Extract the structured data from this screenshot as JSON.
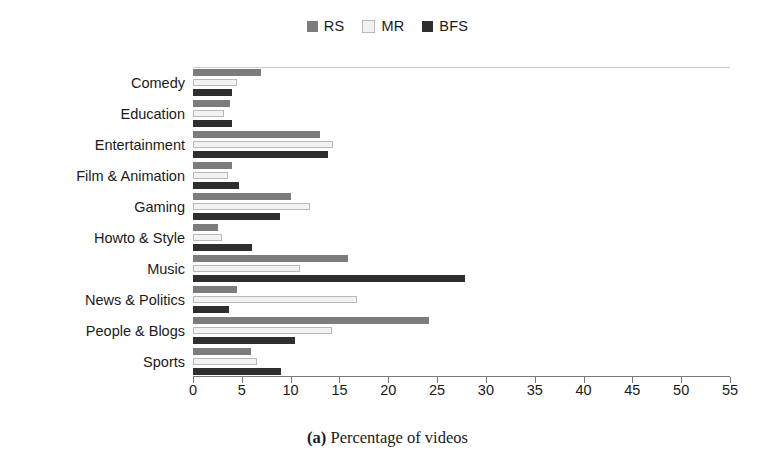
{
  "caption": {
    "label": "(a)",
    "text": " Percentage of videos"
  },
  "legend": {
    "position": "top-center",
    "entries": [
      {
        "name": "RS",
        "color": "#7c7c7c"
      },
      {
        "name": "MR",
        "color": "#f2f2f2"
      },
      {
        "name": "BFS",
        "color": "#2e2e2e"
      }
    ]
  },
  "chart_data": {
    "type": "bar",
    "orientation": "horizontal",
    "title": "",
    "xlabel": "",
    "ylabel": "",
    "xlim": [
      0,
      55
    ],
    "xticks": [
      0,
      5,
      10,
      15,
      20,
      25,
      30,
      35,
      40,
      45,
      50,
      55
    ],
    "grid": false,
    "legend_position": "top-center",
    "categories": [
      "Comedy",
      "Education",
      "Entertainment",
      "Film & Animation",
      "Gaming",
      "Howto & Style",
      "Music",
      "News & Politics",
      "People & Blogs",
      "Sports"
    ],
    "series": [
      {
        "name": "RS",
        "color": "#7c7c7c",
        "values": [
          7.0,
          3.8,
          13.0,
          4.0,
          10.0,
          2.6,
          15.9,
          4.5,
          24.2,
          5.9
        ]
      },
      {
        "name": "MR",
        "color": "#f2f2f2",
        "values": [
          4.5,
          3.2,
          14.3,
          3.6,
          12.0,
          3.0,
          11.0,
          16.8,
          14.2,
          6.6
        ]
      },
      {
        "name": "BFS",
        "color": "#2e2e2e",
        "values": [
          4.0,
          4.0,
          13.8,
          4.7,
          8.9,
          6.0,
          27.9,
          3.7,
          10.4,
          9.0
        ]
      }
    ]
  }
}
